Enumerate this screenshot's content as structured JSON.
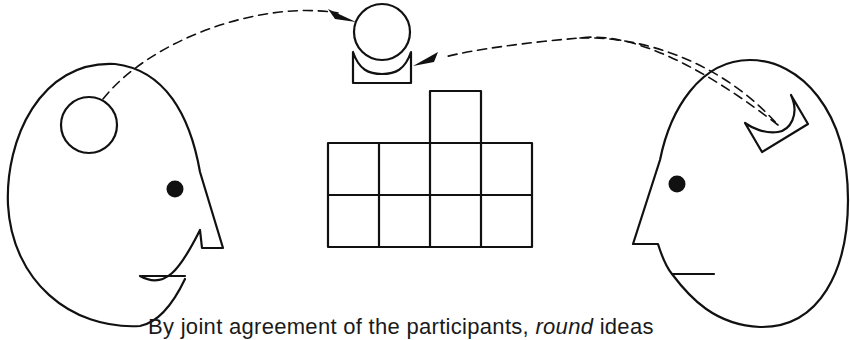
{
  "figure": {
    "type": "illustration",
    "caption": {
      "prefix": "By joint agreement of the participants, ",
      "emphasis": "round",
      "suffix": " ideas"
    },
    "elements": {
      "left_head": {
        "label": "left-speaker-head",
        "idea_shape": "circle"
      },
      "right_head": {
        "label": "right-speaker-head",
        "idea_shape": "cradle"
      },
      "shared_object": {
        "ball": "round-idea-ball",
        "holder": "cradle-holder"
      },
      "grid": {
        "rows": 2,
        "columns": 4,
        "extra_block": "top of column 3"
      }
    },
    "colors": {
      "stroke": "#111111",
      "background": "#ffffff"
    }
  }
}
